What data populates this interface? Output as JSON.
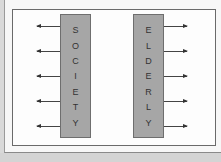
{
  "diagram": {
    "left_box": {
      "label": "SOCIETY",
      "letters": [
        "S",
        "O",
        "C",
        "I",
        "E",
        "T",
        "Y"
      ],
      "arrow_direction": "left",
      "arrow_count": 5
    },
    "right_box": {
      "label": "ELDERLY",
      "letters": [
        "E",
        "L",
        "D",
        "E",
        "R",
        "L",
        "Y"
      ],
      "arrow_direction": "right",
      "arrow_count": 5
    },
    "arrow_y_positions": [
      26,
      51,
      76,
      101,
      126
    ],
    "colors": {
      "box_fill": "#a6a6a6",
      "box_border": "#6e6e6e",
      "arrow": "#444444",
      "frame_border": "#6a6a6a",
      "background": "#fdfdfd"
    }
  }
}
